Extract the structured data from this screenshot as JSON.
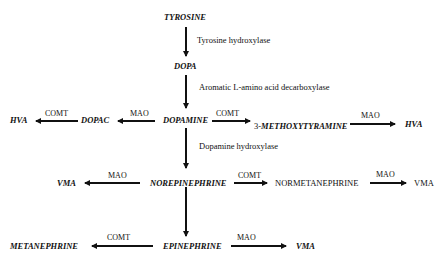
{
  "diagram": {
    "nodes": {
      "tyrosine": "TYROSINE",
      "dopa": "DOPA",
      "dopamine": "DOPAMINE",
      "dopac": "DOPAC",
      "hva_left": "HVA",
      "methoxytyramine_prefix": "3-",
      "methoxytyramine": "METHOXYTYRAMINE",
      "hva_right": "HVA",
      "norepinephrine": "NOREPINEPHRINE",
      "vma_left": "VMA",
      "normetanephrine": "NORMETANEPHRINE",
      "vma_right_plain": "VMA",
      "epinephrine": "EPINEPHRINE",
      "metanephrine": "METANEPHRINE",
      "vma_bottom": "VMA"
    },
    "enzymes": {
      "tyrosine_hydroxylase": "Tyrosine hydroxylase",
      "aadc": "Aromatic L-amino acid decarboxylase",
      "dopamine_hydroxylase": "Dopamine hydroxylase",
      "comt": "COMT",
      "mao": "MAO"
    },
    "edges": [
      {
        "from": "TYROSINE",
        "to": "DOPA",
        "label": "Tyrosine hydroxylase"
      },
      {
        "from": "DOPA",
        "to": "DOPAMINE",
        "label": "Aromatic L-amino acid decarboxylase"
      },
      {
        "from": "DOPAMINE",
        "to": "DOPAC",
        "label": "MAO"
      },
      {
        "from": "DOPAC",
        "to": "HVA",
        "label": "COMT"
      },
      {
        "from": "DOPAMINE",
        "to": "3-METHOXYTYRAMINE",
        "label": "COMT"
      },
      {
        "from": "3-METHOXYTYRAMINE",
        "to": "HVA",
        "label": "MAO"
      },
      {
        "from": "DOPAMINE",
        "to": "NOREPINEPHRINE",
        "label": "Dopamine hydroxylase"
      },
      {
        "from": "NOREPINEPHRINE",
        "to": "VMA",
        "label": "MAO"
      },
      {
        "from": "NOREPINEPHRINE",
        "to": "NORMETANEPHRINE",
        "label": "COMT"
      },
      {
        "from": "NORMETANEPHRINE",
        "to": "VMA",
        "label": "MAO"
      },
      {
        "from": "NOREPINEPHRINE",
        "to": "EPINEPHRINE",
        "label": ""
      },
      {
        "from": "EPINEPHRINE",
        "to": "METANEPHRINE",
        "label": "COMT"
      },
      {
        "from": "EPINEPHRINE",
        "to": "VMA",
        "label": "MAO"
      }
    ]
  }
}
